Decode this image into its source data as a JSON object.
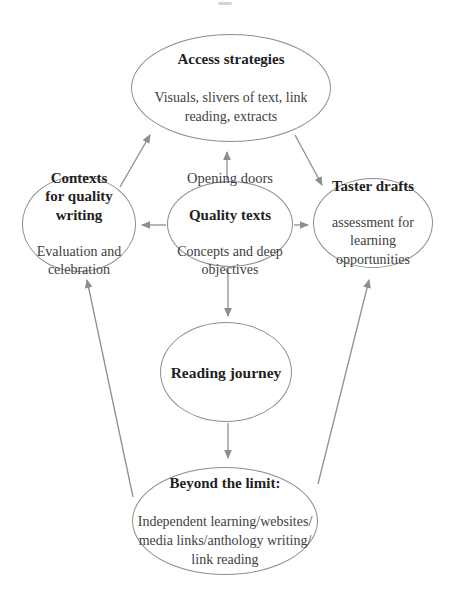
{
  "diagram": {
    "stroke_color": "#8e8e8e",
    "title_color": "#1f1f1f",
    "body_color": "#3e3e3e",
    "background_color": "#ffffff",
    "nodes": {
      "access_strategies": {
        "title": "Access strategies",
        "body": "Visuals, slivers of text, link\nreading, extracts"
      },
      "contexts": {
        "title": "Contexts\nfor quality\nwriting",
        "body": "Evaluation and\ncelebration"
      },
      "quality_texts": {
        "pre_title": "Opening doors",
        "title": "Quality texts",
        "body": "Concepts and deep\nobjectives"
      },
      "taster_drafts": {
        "title": "Taster drafts",
        "body": "assessment for\nlearning\nopportunities"
      },
      "reading_journey": {
        "title": "Reading journey"
      },
      "beyond_the_limit": {
        "title": "Beyond the limit:",
        "body": "Independent learning/websites/\nmedia links/anthology writing/\nlink reading"
      }
    },
    "edges": [
      {
        "from": "quality_texts",
        "to": "access_strategies"
      },
      {
        "from": "contexts",
        "to": "access_strategies"
      },
      {
        "from": "access_strategies",
        "to": "taster_drafts"
      },
      {
        "from": "quality_texts",
        "to": "contexts"
      },
      {
        "from": "quality_texts",
        "to": "taster_drafts"
      },
      {
        "from": "quality_texts",
        "to": "reading_journey"
      },
      {
        "from": "reading_journey",
        "to": "beyond_the_limit"
      },
      {
        "from": "beyond_the_limit",
        "to": "contexts"
      },
      {
        "from": "beyond_the_limit",
        "to": "taster_drafts"
      }
    ]
  }
}
